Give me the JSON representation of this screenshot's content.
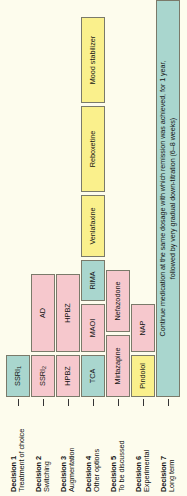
{
  "figure": {
    "colors": {
      "teal": "#a9d6ce",
      "pink": "#f6c8cd",
      "yellow": "#faf08c",
      "background": "#fdfced",
      "border": "#7a7a6a"
    }
  },
  "rows": [
    {
      "number": "Decision 1",
      "subtitle": "Treatment of choice",
      "boxes": [
        {
          "label": "SSRI",
          "sub": "1",
          "color": "teal"
        }
      ]
    },
    {
      "number": "Decision 2",
      "subtitle": "Switching",
      "boxes": [
        {
          "label": "SSRI",
          "sub": "2",
          "color": "pink"
        },
        {
          "label": "AD",
          "color": "pink"
        }
      ]
    },
    {
      "number": "Decision 3",
      "subtitle": "Augmentation",
      "boxes": [
        {
          "label": "HPBZ",
          "color": "pink"
        },
        {
          "label": "HPBZ",
          "color": "pink"
        }
      ]
    },
    {
      "number": "Decision 4",
      "subtitle": "Other options",
      "boxes": [
        {
          "label": "TCA",
          "color": "teal"
        },
        {
          "label": "MAOI",
          "color": "pink"
        },
        {
          "label": "RIMA",
          "color": "teal"
        },
        {
          "label": "Venlafaxine",
          "color": "yellow"
        },
        {
          "label": "Reboxetine",
          "color": "yellow"
        },
        {
          "label": "Mood stabilizer",
          "color": "yellow"
        }
      ]
    },
    {
      "number": "Decision 5",
      "subtitle": "To be discussed",
      "boxes": [
        {
          "label": "Mirtazapine",
          "color": "pink"
        },
        {
          "label": "Nefazodone",
          "color": "pink"
        }
      ]
    },
    {
      "number": "Decision 6",
      "subtitle": "Experimental",
      "boxes": [
        {
          "label": "Pindolol",
          "color": "yellow"
        },
        {
          "label": "NAP",
          "color": "pink"
        }
      ]
    },
    {
      "number": "Decision 7",
      "subtitle": "Long term",
      "boxes": [
        {
          "label": "Continue medication at the same dosage with which remission was achieved, for 1 year,\nfollowed by very gradual down-titration (6–8 weeks)",
          "color": "teal"
        }
      ]
    }
  ]
}
